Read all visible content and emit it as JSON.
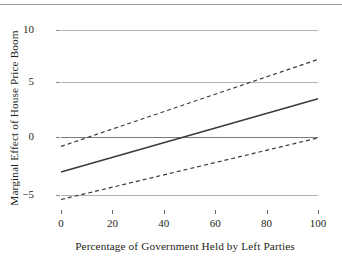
{
  "figure": {
    "background_color": "#ffffff",
    "text_color": "#231f20",
    "top_rule_color": "#9a9a9a"
  },
  "axis": {
    "ylabel": "Marginal Effect of House Price Boom",
    "xlabel": "Percentage of Government Held by Left Parties",
    "yticks": [
      "10",
      "5",
      "0",
      "−5"
    ],
    "ytick_values": [
      10,
      5,
      0,
      -5
    ],
    "xticks": [
      "0",
      "20",
      "40",
      "60",
      "80",
      "100"
    ],
    "xtick_values": [
      0,
      20,
      40,
      60,
      80,
      100
    ]
  },
  "style": {
    "gridline_color": "#b4b4b4",
    "zero_line_color": "#7b7b7b",
    "estimate_color": "#3a3a3a",
    "ci_color": "#3a3a3a"
  },
  "chart_data": {
    "type": "line",
    "title": "",
    "xlabel": "Percentage of Government Held by Left Parties",
    "ylabel": "Marginal Effect of House Price Boom",
    "xlim": [
      0,
      100
    ],
    "ylim": [
      -6.6,
      11.3
    ],
    "grid": true,
    "gridlines_y": [
      10,
      5,
      0,
      -5
    ],
    "legend": "none",
    "annotations": [
      "Solid line is the marginal effect estimate; dashed lines are the 95% confidence bounds.",
      "Estimate crosses zero at approximately 50 percent.",
      "Upper confidence bound crosses zero at approximately 28 percent.",
      "Lower confidence bound reaches zero at approximately 100 percent."
    ],
    "x": [
      0,
      100
    ],
    "series": [
      {
        "name": "Marginal effect (point estimate)",
        "style": "solid",
        "values": [
          -3.2,
          3.7
        ]
      },
      {
        "name": "Upper 95% confidence bound",
        "style": "dashed",
        "values": [
          -0.8,
          7.4
        ]
      },
      {
        "name": "Lower 95% confidence bound",
        "style": "dashed",
        "values": [
          -5.8,
          0.0
        ]
      }
    ]
  }
}
